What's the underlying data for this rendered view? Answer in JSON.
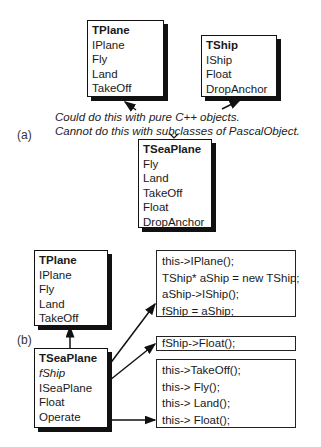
{
  "part_a": {
    "label": "(a)",
    "tplane": {
      "title": "TPlane",
      "methods": [
        "IPlane",
        "Fly",
        "Land",
        "TakeOff"
      ]
    },
    "tship": {
      "title": "TShip",
      "methods": [
        "IShip",
        "Float",
        "DropAnchor"
      ]
    },
    "note": [
      "Could do this with pure C++ objects.",
      "Cannot do this with subclasses of PascalObject."
    ],
    "tseaplane": {
      "title": "TSeaPlane",
      "methods": [
        "Fly",
        "Land",
        "TakeOff",
        "Float",
        "DropAnchor"
      ]
    }
  },
  "part_b": {
    "label": "(b)",
    "tplane": {
      "title": "TPlane",
      "methods": [
        "IPlane",
        "Fly",
        "Land",
        "TakeOff"
      ]
    },
    "tseaplane": {
      "title": "TSeaPlane",
      "field": "fShip",
      "methods": [
        "ISeaPlane",
        "Float",
        "Operate"
      ]
    },
    "code_iseaplane": [
      "this->IPlane();",
      "TShip* aShip = new TShip;",
      "aShip->IShip();",
      "fShip = aShip;"
    ],
    "code_float": [
      "fShip->Float();"
    ],
    "code_operate": [
      "this->TakeOff();",
      "this-> Fly();",
      "this-> Land();",
      "this-> Float();"
    ]
  }
}
